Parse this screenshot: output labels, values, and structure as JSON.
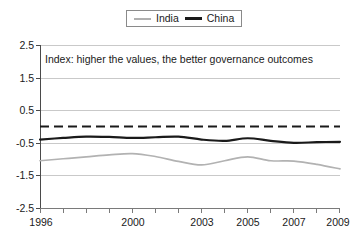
{
  "legend": {
    "position": "top-center",
    "entries": [
      {
        "label": "India",
        "color": "#b2b2b2",
        "style": "thin-gray"
      },
      {
        "label": "China",
        "color": "#1a1a1a",
        "style": "thick-black"
      }
    ]
  },
  "annotation": {
    "text": "Index: higher the values, the better governance outcomes"
  },
  "axes": {
    "y_ticks": [
      "2.5",
      "1.5",
      "0.5",
      "-0.5",
      "-1.5",
      "-2.5"
    ],
    "x_ticks": [
      "1996",
      "2000",
      "2003",
      "2005",
      "2007",
      "2009"
    ]
  },
  "chart_data": {
    "type": "line",
    "title": "",
    "subtitle": "",
    "xlabel": "",
    "ylabel": "",
    "xlim": [
      1996,
      2009
    ],
    "ylim": [
      -2.5,
      2.5
    ],
    "ytick_values": [
      2.5,
      1.5,
      0.5,
      -0.5,
      -1.5,
      -2.5
    ],
    "xtick_values": [
      1996,
      2000,
      2003,
      2005,
      2007,
      2009
    ],
    "grid": true,
    "legend_position": "top-center",
    "annotations": [
      {
        "text": "Index: higher the values, the better governance outcomes",
        "x": 1996.2,
        "y": 2.0
      }
    ],
    "reference_lines": [
      {
        "name": "zero-line",
        "y": 0,
        "style": "dashed",
        "color": "#1a1a1a"
      }
    ],
    "x": [
      1996,
      1997,
      1998,
      1999,
      2000,
      2001,
      2002,
      2003,
      2004,
      2005,
      2006,
      2007,
      2008,
      2009
    ],
    "series": [
      {
        "name": "India",
        "color": "#b2b2b2",
        "values": [
          -1.05,
          -0.99,
          -0.93,
          -0.87,
          -0.83,
          -0.92,
          -1.07,
          -1.18,
          -1.05,
          -0.93,
          -1.05,
          -1.06,
          -1.16,
          -1.3
        ]
      },
      {
        "name": "China",
        "color": "#1a1a1a",
        "values": [
          -0.4,
          -0.35,
          -0.31,
          -0.32,
          -0.35,
          -0.33,
          -0.31,
          -0.4,
          -0.44,
          -0.36,
          -0.44,
          -0.5,
          -0.48,
          -0.47
        ]
      }
    ]
  }
}
